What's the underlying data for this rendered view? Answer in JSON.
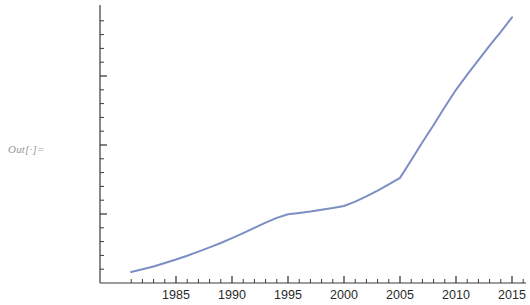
{
  "output_label": "Out[·]=",
  "chart_data": {
    "type": "line",
    "title": "",
    "xlabel": "",
    "ylabel": "",
    "xlim": [
      1981,
      2016
    ],
    "ylim": [
      0,
      19600
    ],
    "grid": false,
    "legend": false,
    "legend_position": "none",
    "line_color": "#7b8fc4",
    "line_width": 2,
    "axis_color": "#3a3a3a",
    "tick_label_color": "#2b2b2b",
    "x_tick_labels": [
      "1985",
      "1990",
      "1995",
      "2000",
      "2005",
      "2010",
      "2015"
    ],
    "x_tick_values": [
      1985,
      1990,
      1995,
      2000,
      2005,
      2010,
      2015
    ],
    "x_minor_tick_step": 1,
    "y_tick_labels": [
      "5000",
      "10 000",
      "15 000"
    ],
    "y_tick_values": [
      5000,
      10000,
      15000
    ],
    "y_minor_tick_step": 1000,
    "x": [
      1981,
      1982,
      1983,
      1984,
      1985,
      1986,
      1987,
      1988,
      1989,
      1990,
      1991,
      1992,
      1993,
      1994,
      1995,
      1996,
      1997,
      1998,
      1999,
      2000,
      2001,
      2002,
      2003,
      2004,
      2005,
      2006,
      2007,
      2008,
      2009,
      2010,
      2011,
      2012,
      2013,
      2014,
      2015
    ],
    "values": [
      800,
      1000,
      1200,
      1450,
      1700,
      1980,
      2270,
      2580,
      2900,
      3250,
      3620,
      4000,
      4380,
      4720,
      4980,
      5080,
      5180,
      5300,
      5430,
      5580,
      5900,
      6280,
      6700,
      7150,
      7620,
      8900,
      10200,
      11450,
      12750,
      14000,
      15100,
      16150,
      17200,
      18200,
      19250
    ]
  }
}
